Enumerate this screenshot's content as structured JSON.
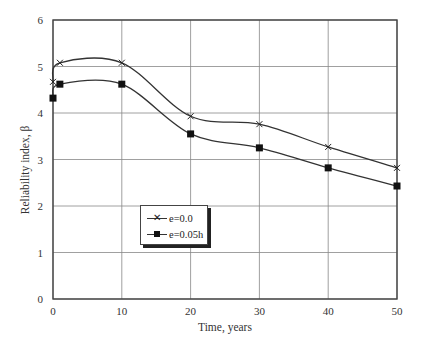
{
  "chart_data": {
    "type": "line",
    "title": "",
    "xlabel": "Time, years",
    "ylabel": "Reliability index, β",
    "xlim": [
      0,
      50
    ],
    "ylim": [
      0,
      6
    ],
    "xticks": [
      0,
      10,
      20,
      30,
      40,
      50
    ],
    "yticks": [
      0,
      1,
      2,
      3,
      4,
      5,
      6
    ],
    "grid": true,
    "legend_position": "lower-left-center",
    "series": [
      {
        "name": "e=0.0",
        "marker": "x",
        "x": [
          0,
          1,
          10,
          20,
          30,
          40,
          50
        ],
        "values": [
          4.67,
          5.08,
          5.08,
          3.93,
          3.76,
          3.27,
          2.82
        ]
      },
      {
        "name": "e=0.05h",
        "marker": "square",
        "x": [
          0,
          1,
          10,
          20,
          30,
          40,
          50
        ],
        "values": [
          4.32,
          4.62,
          4.62,
          3.55,
          3.25,
          2.82,
          2.43
        ]
      }
    ]
  },
  "labels": {
    "xlabel": "Time, years",
    "ylabel": "Reliability index, β",
    "legend": [
      "e=0.0",
      "e=0.05h"
    ],
    "xticks": [
      "0",
      "10",
      "20",
      "30",
      "40",
      "50"
    ],
    "yticks": [
      "0",
      "1",
      "2",
      "3",
      "4",
      "5",
      "6"
    ]
  }
}
